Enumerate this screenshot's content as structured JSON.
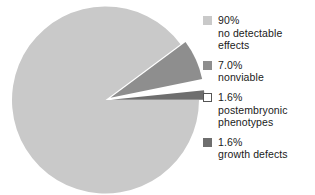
{
  "chart_data": {
    "type": "pie",
    "title": "",
    "subtitle": "",
    "xlabel": "",
    "ylabel": "",
    "legend_position": "right",
    "grid": false,
    "start_angle_deg": 0,
    "direction": "clockwise",
    "categories": [
      "no detectable effects",
      "nonviable",
      "postembryonic phenotypes",
      "growth defects"
    ],
    "values": [
      90.0,
      7.0,
      1.6,
      1.6
    ],
    "value_labels": [
      "90%",
      "7.0%",
      "1.6%",
      "1.6%"
    ],
    "colors": [
      "#c9c9c9",
      "#8e8e8e",
      "#ffffff",
      "#6e6e6e"
    ],
    "exploded": [
      false,
      true,
      true,
      true
    ],
    "slices": [
      {
        "label": "no detectable effects",
        "value": 90.0,
        "value_label": "90%",
        "color": "#c9c9c9",
        "exploded": false
      },
      {
        "label": "nonviable",
        "value": 7.0,
        "value_label": "7.0%",
        "color": "#8e8e8e",
        "exploded": true
      },
      {
        "label": "postembryonic phenotypes",
        "value": 1.6,
        "value_label": "1.6%",
        "color": "#ffffff",
        "exploded": true
      },
      {
        "label": "growth defects",
        "value": 1.6,
        "value_label": "1.6%",
        "color": "#6e6e6e",
        "exploded": true
      }
    ]
  },
  "legend": {
    "entries": [
      {
        "swatch_color": "#c9c9c9",
        "line1": "90%",
        "line2": "no detectable",
        "line3": "effects"
      },
      {
        "swatch_color": "#8e8e8e",
        "line1": "7.0%",
        "line2": "nonviable",
        "line3": ""
      },
      {
        "swatch_color": "#ffffff",
        "line1": "1.6%",
        "line2": "postembryonic",
        "line3": "phenotypes"
      },
      {
        "swatch_color": "#6e6e6e",
        "line1": "1.6%",
        "line2": "growth defects",
        "line3": ""
      }
    ]
  }
}
